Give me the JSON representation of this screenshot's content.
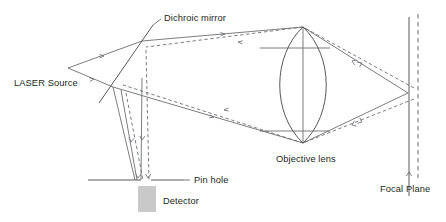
{
  "figure": {
    "background_color": "#ffffff",
    "line_color": "#6d6e71",
    "optic_color": "#58595b",
    "text_color": "#231f20",
    "detector_fill": "#c9c9c9",
    "width": 446,
    "height": 222
  },
  "labels": {
    "laser_source": "LASER Source",
    "dichroic_mirror": "Dichroic mirror",
    "pin_hole": "Pin hole",
    "detector": "Detector",
    "objective_lens": "Objective lens",
    "focal_plane": "Focal Plane"
  },
  "components": {
    "laser_source_point": {
      "x": 68,
      "y": 68
    },
    "dichroic_mirror": {
      "x1": 99,
      "y1": 103,
      "x2": 153,
      "y2": 25
    },
    "objective_lens": {
      "cx": 303,
      "top_y": 27,
      "bottom_y": 143,
      "half_width": 26
    },
    "pin_hole_line": {
      "x1": 88,
      "y1": 180,
      "x2": 184,
      "y2": 180
    },
    "pin_hole_gap": {
      "x1": 141,
      "x2": 151
    },
    "detector_box": {
      "x": 138,
      "y": 186,
      "width": 18,
      "height": 26
    },
    "focal_plane_solid": {
      "x": 409,
      "y1": 17,
      "y2": 196
    },
    "focal_plane_dashed": {
      "x": 418,
      "y1": 14,
      "y2": 178
    },
    "focus_point": {
      "x": 408,
      "y": 93
    }
  },
  "beams": {
    "excitation_style": "solid",
    "emission_style": "dashed",
    "arrow_count": 14
  }
}
